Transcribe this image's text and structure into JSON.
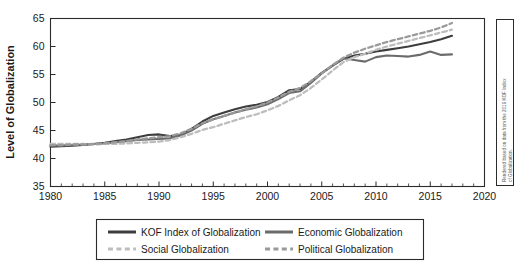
{
  "chart_data": {
    "type": "line",
    "title": "",
    "subtitle": "",
    "xlabel": "",
    "ylabel": "Level of Globalization",
    "xlim": [
      1980,
      2020
    ],
    "ylim": [
      35,
      65
    ],
    "xticks": [
      1980,
      1985,
      1990,
      1995,
      2000,
      2005,
      2010,
      2015,
      2020
    ],
    "yticks": [
      35,
      40,
      45,
      50,
      55,
      60,
      65
    ],
    "xtick_labels": [
      "1980",
      "1985",
      "1990",
      "1995",
      "2000",
      "2005",
      "2010",
      "2015",
      "2020"
    ],
    "ytick_labels": [
      "35",
      "40",
      "45",
      "50",
      "55",
      "60",
      "65"
    ],
    "minor_tick_step": 1,
    "grid": false,
    "legend_position": "below-axes",
    "x": [
      1980,
      1981,
      1982,
      1983,
      1984,
      1985,
      1986,
      1987,
      1988,
      1989,
      1990,
      1991,
      1992,
      1993,
      1994,
      1995,
      1996,
      1997,
      1998,
      1999,
      2000,
      2001,
      2002,
      2003,
      2004,
      2005,
      2006,
      2007,
      2008,
      2009,
      2010,
      2011,
      2012,
      2013,
      2014,
      2015,
      2016,
      2017
    ],
    "series": [
      {
        "name": "KOF Index of Globalization",
        "color": "#3d3d3d",
        "style": "solid",
        "width": 2.1,
        "values": [
          42.1,
          42.2,
          42.3,
          42.4,
          42.6,
          42.8,
          43.1,
          43.4,
          43.8,
          44.2,
          44.3,
          44.0,
          44.2,
          45.3,
          46.6,
          47.6,
          48.2,
          48.8,
          49.3,
          49.6,
          50.1,
          51.0,
          52.2,
          52.4,
          53.7,
          55.3,
          56.6,
          57.8,
          58.4,
          58.7,
          59.1,
          59.4,
          59.7,
          60.0,
          60.4,
          60.8,
          61.3,
          61.9
        ]
      },
      {
        "name": "Economic Globalization",
        "color": "#6b6b6b",
        "style": "solid",
        "width": 2.1,
        "values": [
          42.3,
          42.3,
          42.4,
          42.5,
          42.6,
          42.7,
          42.9,
          43.1,
          43.3,
          43.4,
          43.5,
          43.6,
          44.1,
          45.0,
          46.2,
          47.0,
          47.6,
          48.2,
          48.7,
          49.1,
          49.7,
          50.6,
          51.7,
          52.0,
          53.5,
          55.2,
          56.6,
          57.9,
          57.6,
          57.3,
          58.1,
          58.4,
          58.3,
          58.2,
          58.5,
          59.1,
          58.5,
          58.6
        ]
      },
      {
        "name": "Social Globalization",
        "color": "#bdbdbd",
        "style": "dashed",
        "width": 2.3,
        "values": [
          42.6,
          42.6,
          42.6,
          42.6,
          42.5,
          42.6,
          42.6,
          42.7,
          42.8,
          42.9,
          43.0,
          43.3,
          43.8,
          44.4,
          45.1,
          45.6,
          46.2,
          46.8,
          47.4,
          47.9,
          48.6,
          49.4,
          50.4,
          51.3,
          52.6,
          54.1,
          55.7,
          57.2,
          58.1,
          58.7,
          59.4,
          60.0,
          60.5,
          61.0,
          61.5,
          62.0,
          62.5,
          63.0
        ]
      },
      {
        "name": "Political Globalization",
        "color": "#9a9a9a",
        "style": "dashed",
        "width": 2.3,
        "values": [
          42.4,
          42.4,
          42.5,
          42.5,
          42.6,
          42.7,
          42.9,
          43.1,
          43.4,
          43.6,
          43.8,
          44.0,
          44.5,
          45.3,
          46.3,
          47.0,
          47.6,
          48.2,
          48.8,
          49.3,
          50.0,
          50.9,
          51.9,
          52.6,
          53.8,
          55.2,
          56.7,
          58.0,
          58.9,
          59.6,
          60.2,
          60.8,
          61.3,
          61.8,
          62.3,
          62.8,
          63.4,
          64.2
        ]
      }
    ]
  },
  "axes": {
    "y_title": "Level of Globalization",
    "y_tick_labels": [
      "65",
      "60",
      "55",
      "50",
      "45",
      "40",
      "35"
    ],
    "x_tick_labels": [
      "1980",
      "1985",
      "1990",
      "1995",
      "2000",
      "2005",
      "2010",
      "2015",
      "2020"
    ]
  },
  "legend": {
    "entries": [
      {
        "label": "KOF Index of Globalization",
        "color": "#3d3d3d",
        "style": "solid"
      },
      {
        "label": "Economic Globalization",
        "color": "#6b6b6b",
        "style": "solid"
      },
      {
        "label": "Social Globalization",
        "color": "#bdbdbd",
        "style": "dashed"
      },
      {
        "label": "Political Globalization",
        "color": "#9a9a9a",
        "style": "dashed"
      }
    ]
  },
  "credit": {
    "line1": "Rendered based on data from the 2019 KOF Index",
    "line2": "of Globalization."
  }
}
